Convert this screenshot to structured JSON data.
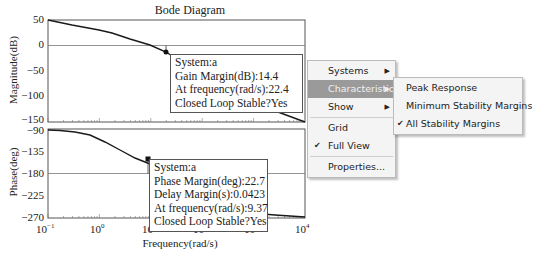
{
  "chart_data": [
    {
      "type": "line",
      "title": "Bode Diagram",
      "panel": "magnitude",
      "xlabel": "Frequency(rad/s)",
      "ylabel": "Magnitude(dB)",
      "xscale": "log",
      "xlim": [
        0.1,
        10000
      ],
      "ylim": [
        -150,
        50
      ],
      "yticks": [
        50,
        0,
        -50,
        -100,
        -150
      ],
      "x": [
        0.1,
        0.3,
        1,
        3,
        10,
        22.4,
        100,
        1000,
        10000
      ],
      "values": [
        50,
        41,
        33,
        20,
        2,
        -14.4,
        -55,
        -105,
        -150
      ],
      "annotation_point": {
        "x": 22.4,
        "y": -14.4
      }
    },
    {
      "type": "line",
      "panel": "phase",
      "xlabel": "Frequency(rad/s)",
      "ylabel": "Phase(deg)",
      "xscale": "log",
      "xlim": [
        0.1,
        10000
      ],
      "ylim": [
        -270,
        -90
      ],
      "yticks": [
        -90,
        -135,
        -180,
        -225,
        -270
      ],
      "xticks": [
        "10^-1",
        "10^0",
        "10^1",
        "10^2",
        "10^3",
        "10^4"
      ],
      "x": [
        0.1,
        0.3,
        1,
        3,
        9.37,
        30,
        100,
        1000,
        10000
      ],
      "values": [
        -91,
        -93,
        -102,
        -125,
        -157.3,
        -200,
        -240,
        -262,
        -268
      ],
      "annotation_point": {
        "x": 9.37,
        "y": -157.3
      }
    }
  ],
  "plot": {
    "title": "Bode Diagram",
    "mag_ylabel": "Magnitude(dB)",
    "phase_ylabel": "Phase(deg)",
    "xlabel": "Frequency(rad/s)",
    "mag_ticks": [
      "50",
      "0",
      "−50",
      "−100",
      "−150"
    ],
    "phase_ticks": [
      "−90",
      "−135",
      "−180",
      "−225",
      "−270"
    ],
    "x_ticks": [
      {
        "base": "10",
        "exp": "−1"
      },
      {
        "base": "10",
        "exp": "0"
      },
      {
        "base": "10",
        "exp": "1"
      },
      {
        "base": "10",
        "exp": "2"
      },
      {
        "base": "10",
        "exp": "3"
      },
      {
        "base": "10",
        "exp": "4"
      }
    ]
  },
  "gain_tooltip": {
    "line1": "System:a",
    "line2": "Gain Margin(dB):14.4",
    "line3": "At frequency(rad/s):22.4",
    "line4": "Closed Loop Stable?Yes"
  },
  "phase_tooltip": {
    "line1": "System:a",
    "line2": "Phase Margin(deg):22.7",
    "line3": "Delay Margin(s):0.0423",
    "line4": "At frequency(rad/s):9.37",
    "line5": "Closed Loop Stable?Yes"
  },
  "context_menu": {
    "items": [
      {
        "label": "Systems",
        "submenu": true
      },
      {
        "label": "Characteristics",
        "submenu": true,
        "highlighted": true
      },
      {
        "label": "Show",
        "submenu": true
      },
      {
        "label": "Grid"
      },
      {
        "label": "Full View",
        "checked": true
      },
      {
        "label": "Properties..."
      }
    ],
    "check_glyph": "✔",
    "arrow_glyph": "▶"
  },
  "characteristics_submenu": {
    "items": [
      {
        "label": "Peak Response"
      },
      {
        "label": "Minimum Stability Margins"
      },
      {
        "label": "All Stability Margins",
        "checked": true
      }
    ]
  },
  "colors": {
    "curve": "#1a1a1a",
    "menu_highlight": "#9a9a9a",
    "menu_bg": "#f4f4f4"
  }
}
